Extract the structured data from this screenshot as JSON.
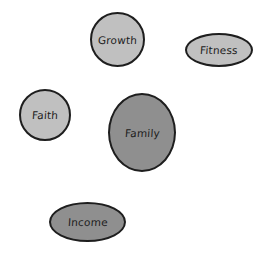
{
  "diagram": {
    "nodes": [
      {
        "id": "growth",
        "label": "Growth",
        "shape": "circle",
        "fill": "#c0c0c0",
        "x": 90,
        "y": 12,
        "w": 55,
        "h": 55
      },
      {
        "id": "fitness",
        "label": "Fitness",
        "shape": "ellipse",
        "fill": "#c0c0c0",
        "x": 185,
        "y": 33,
        "w": 68,
        "h": 34
      },
      {
        "id": "faith",
        "label": "Faith",
        "shape": "circle",
        "fill": "#c0c0c0",
        "x": 19,
        "y": 89,
        "w": 52,
        "h": 52
      },
      {
        "id": "family",
        "label": "Family",
        "shape": "circle",
        "fill": "#8f8f8f",
        "x": 108,
        "y": 93,
        "w": 68,
        "h": 79
      },
      {
        "id": "income",
        "label": "Income",
        "shape": "ellipse",
        "fill": "#8f8f8f",
        "x": 49,
        "y": 202,
        "w": 77,
        "h": 40
      }
    ],
    "stroke_color": "#1e1e1e"
  }
}
